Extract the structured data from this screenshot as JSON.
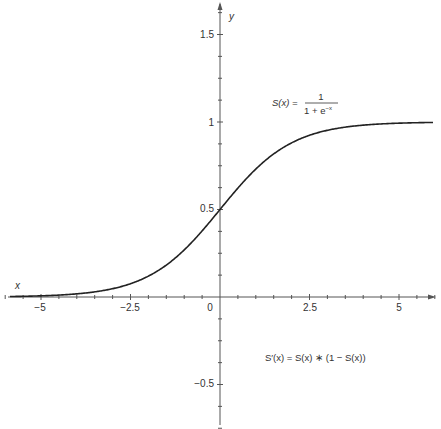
{
  "chart_data": {
    "type": "line",
    "title": "",
    "xlabel": "x",
    "ylabel": "y",
    "xlim": [
      -6,
      6
    ],
    "ylim": [
      -0.75,
      1.75
    ],
    "grid": false,
    "legend": null,
    "x_ticks": [
      -5,
      -2.5,
      0,
      2.5,
      5
    ],
    "x_tick_labels": [
      "−5",
      "−2.5",
      "0",
      "2.5",
      "5"
    ],
    "y_ticks": [
      -0.5,
      0.5,
      1,
      1.5
    ],
    "y_tick_labels": [
      "−0.5",
      "0.5",
      "1",
      "1.5"
    ],
    "series": [
      {
        "name": "S(x) = 1 / (1 + e^-x)",
        "function": "sigmoid",
        "color": "#222222",
        "x": [
          -6,
          -5,
          -4,
          -3,
          -2.5,
          -2,
          -1,
          0,
          1,
          2,
          2.5,
          3,
          4,
          5,
          6
        ],
        "y": [
          0.0025,
          0.0067,
          0.018,
          0.047,
          0.076,
          0.119,
          0.269,
          0.5,
          0.731,
          0.881,
          0.924,
          0.953,
          0.982,
          0.993,
          0.9975
        ]
      }
    ],
    "annotations": [
      {
        "text_lhs": "S(x) =",
        "numerator": "1",
        "denominator_base": "1 + e",
        "denominator_exp": "−x"
      },
      {
        "text": "S′(x) = S(x) ∗ (1 − S(x))"
      }
    ]
  }
}
